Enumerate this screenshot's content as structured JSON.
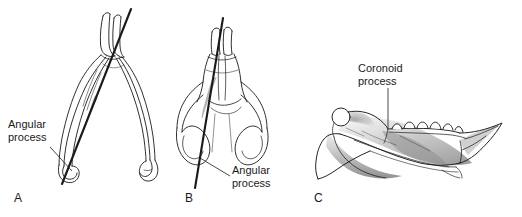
{
  "figure": {
    "background_color": "#ffffff",
    "ink_color": "#1a1a1a",
    "shading_color": "#8c8c8c",
    "type": "anatomical line illustration"
  },
  "panels": [
    {
      "letter": "A",
      "view": "dorsal oblique outline of mandible with angle reference line",
      "callout": {
        "line1": "Angular",
        "line2": "process"
      }
    },
    {
      "letter": "B",
      "view": "ventral outline of mandible with angle reference line",
      "callout": {
        "line1": "Angular",
        "line2": "process"
      }
    },
    {
      "letter": "C",
      "view": "lateral shaded mandible with tooth row",
      "callout": {
        "line1": "Coronoid",
        "line2": "process"
      }
    }
  ]
}
